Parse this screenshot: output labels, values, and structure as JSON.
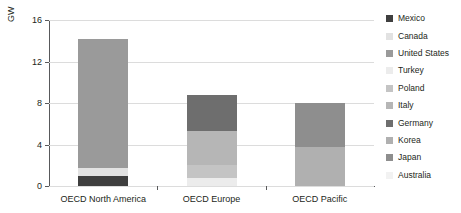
{
  "chart_data": {
    "type": "bar",
    "subtype": "stacked-bar",
    "title": "",
    "xlabel": "",
    "ylabel": "GW",
    "ylim": [
      0,
      16
    ],
    "yticks": [
      0,
      4,
      8,
      12,
      16
    ],
    "ytick_labels": [
      "0",
      "4",
      "8",
      "12",
      "16"
    ],
    "grid": true,
    "grid_axis": "y",
    "legend_position": "right",
    "categories": [
      "OECD North America",
      "OECD Europe",
      "OECD Pacific"
    ],
    "series": [
      {
        "name": "Mexico",
        "color": "#3f3f3f",
        "values": [
          1.0,
          0,
          0
        ]
      },
      {
        "name": "Canada",
        "color": "#e2e2e2",
        "values": [
          0.7,
          0,
          0
        ]
      },
      {
        "name": "United States",
        "color": "#9a9a9a",
        "values": [
          12.5,
          0,
          0
        ]
      },
      {
        "name": "Turkey",
        "color": "#ececec",
        "values": [
          0,
          0.8,
          0
        ]
      },
      {
        "name": "Poland",
        "color": "#c4c4c4",
        "values": [
          0,
          1.2,
          0
        ]
      },
      {
        "name": "Italy",
        "color": "#b6b6b6",
        "values": [
          0,
          3.3,
          0
        ]
      },
      {
        "name": "Germany",
        "color": "#6e6e6e",
        "values": [
          0,
          3.5,
          0
        ]
      },
      {
        "name": "Korea",
        "color": "#b0b0b0",
        "values": [
          0,
          0,
          3.8
        ]
      },
      {
        "name": "Japan",
        "color": "#8e8e8e",
        "values": [
          0,
          0,
          4.2
        ]
      },
      {
        "name": "Australia",
        "color": "#f2f2f2",
        "values": [
          0,
          0,
          0
        ]
      }
    ],
    "totals": [
      14.2,
      8.8,
      8.0
    ],
    "annotations": []
  },
  "legend": {
    "items": [
      {
        "label": "Mexico",
        "color": "#3f3f3f"
      },
      {
        "label": "Canada",
        "color": "#e2e2e2"
      },
      {
        "label": "United States",
        "color": "#9a9a9a"
      },
      {
        "label": "Turkey",
        "color": "#ececec"
      },
      {
        "label": "Poland",
        "color": "#c4c4c4"
      },
      {
        "label": "Italy",
        "color": "#b6b6b6"
      },
      {
        "label": "Germany",
        "color": "#6e6e6e"
      },
      {
        "label": "Korea",
        "color": "#b0b0b0"
      },
      {
        "label": "Japan",
        "color": "#8e8e8e"
      },
      {
        "label": "Australia",
        "color": "#f2f2f2"
      }
    ]
  },
  "axis": {
    "y_title": "GW"
  }
}
